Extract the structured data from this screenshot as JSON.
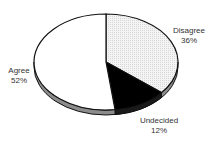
{
  "chart_data": {
    "type": "pie",
    "title": "",
    "style": "3d-tilted",
    "categories": [
      "Disagree",
      "Undecided",
      "Agree"
    ],
    "values": [
      36,
      12,
      52
    ],
    "value_labels": [
      "36%",
      "12%",
      "52%"
    ],
    "start_angle": "12 o'clock",
    "direction": "clockwise",
    "colors": {
      "Disagree": "#ececec",
      "Undecided": "#000000",
      "Agree": "#ffffff",
      "rim": "#8c8c8c",
      "outline": "#111111"
    },
    "legend": "none (direct labels)"
  },
  "labels": {
    "disagree": {
      "name": "Disagree",
      "pct": "36%"
    },
    "undecided": {
      "name": "Undecided",
      "pct": "12%"
    },
    "agree": {
      "name": "Agree",
      "pct": "52%"
    }
  }
}
